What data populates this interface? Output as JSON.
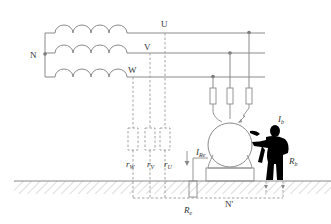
{
  "diagram": {
    "type": "electrical-schematic",
    "labels": {
      "neutral": "N",
      "phase_u": "U",
      "phase_v": "V",
      "phase_w": "W",
      "r_w": "r",
      "r_w_sub": "W",
      "r_v": "r",
      "r_v_sub": "V",
      "r_u": "r",
      "r_u_sub": "U",
      "i_re": "I",
      "i_re_sub": "Re",
      "r_e": "R",
      "r_e_sub": "e",
      "i_b": "I",
      "i_b_sub": "b",
      "r_b": "R",
      "r_b_sub": "b",
      "earth_neutral": "N'"
    },
    "colors": {
      "line": "#8a8a8a",
      "dashed": "#9a9a9a",
      "person": "#000000",
      "hatch": "#c8c8c8",
      "text": "#333333"
    }
  }
}
